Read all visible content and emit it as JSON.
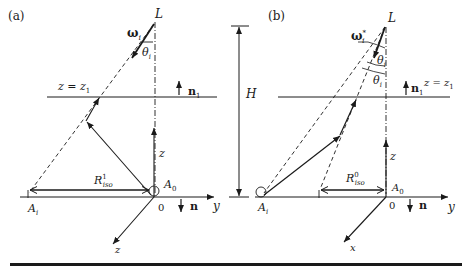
{
  "figure": {
    "panels": [
      {
        "id": "a",
        "label": "(a)",
        "light_source": "L",
        "direction_symbol": "ω",
        "direction_subscript": "i",
        "angle_symbol": "θ",
        "angle_subscript": "i",
        "plane_label": "z = z",
        "plane_subscript": "1",
        "plane_normal": "n",
        "plane_normal_subscript": "1",
        "radius_symbol": "R",
        "radius_sub": "iso",
        "radius_sup": "1",
        "origin_point": "A",
        "origin_point_sub": "0",
        "target_point": "A",
        "target_point_sub": "i",
        "origin_label": "0",
        "ground_normal": "n",
        "axes": {
          "vertical": "z",
          "horizontal": "y",
          "diagonal": "z"
        }
      },
      {
        "id": "b",
        "label": "(b)",
        "light_source": "L",
        "direction_symbol": "ω",
        "direction_subscript": "i",
        "direction_superscript": "*",
        "angle_symbol": "θ",
        "angle_subscript": "i",
        "plane_label": "z = z",
        "plane_subscript": "1",
        "plane_normal": "n",
        "plane_normal_subscript": "1",
        "radius_symbol": "R",
        "radius_sub": "iso",
        "radius_sup": "0",
        "origin_point": "A",
        "origin_point_sub": "0",
        "target_point": "A",
        "target_point_sub": "i",
        "origin_label": "0",
        "ground_normal": "n",
        "axes": {
          "vertical": "z",
          "horizontal": "y",
          "diagonal": "x"
        }
      }
    ],
    "height_marker": "H",
    "colors": {
      "stroke": "#1a1a1a",
      "background": "#ffffff"
    }
  }
}
